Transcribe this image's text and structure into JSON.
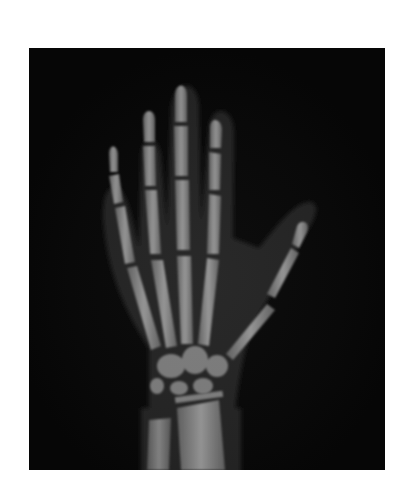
{
  "image": {
    "subject": "Hand X-ray radiograph",
    "alt": "X-ray of a child's left hand and wrist showing finger bones, metacarpals, carpals and growth plates",
    "background_color": "#ffffff",
    "film_color": "#060606",
    "bone_color": "#8a8a8a"
  }
}
